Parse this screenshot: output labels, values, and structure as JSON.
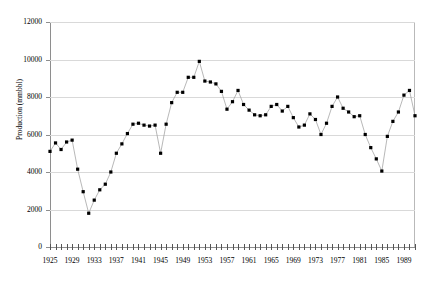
{
  "chart_data": {
    "type": "line",
    "title": "",
    "xlabel": "",
    "ylabel": "Production (mmbbl)",
    "xlim": [
      1925,
      1991
    ],
    "ylim": [
      0,
      12000
    ],
    "grid": true,
    "legend": "none",
    "y_ticks": [
      0,
      2000,
      4000,
      6000,
      8000,
      10000,
      12000
    ],
    "y_tick_labels": [
      "0",
      "2000",
      "4000",
      "6000",
      "8000",
      "10000",
      "12000"
    ],
    "x_tick_labels": [
      "1925",
      "1929",
      "1933",
      "1937",
      "1941",
      "1945",
      "1949",
      "1953",
      "1957",
      "1961",
      "1965",
      "1969",
      "1973",
      "1977",
      "1981",
      "1985",
      "1989"
    ],
    "x_tick_step": 4,
    "x_minor_tick_step": 1,
    "marker": "square",
    "marker_color": "#000000",
    "line_color": "#9a9a9a",
    "x": [
      1925,
      1926,
      1927,
      1928,
      1929,
      1930,
      1931,
      1932,
      1933,
      1934,
      1935,
      1936,
      1937,
      1938,
      1939,
      1940,
      1941,
      1942,
      1943,
      1944,
      1945,
      1946,
      1947,
      1948,
      1949,
      1950,
      1951,
      1952,
      1953,
      1954,
      1955,
      1956,
      1957,
      1958,
      1959,
      1960,
      1961,
      1962,
      1963,
      1964,
      1965,
      1966,
      1967,
      1968,
      1969,
      1970,
      1971,
      1972,
      1973,
      1974,
      1975,
      1976,
      1977,
      1978,
      1979,
      1980,
      1981,
      1982,
      1983,
      1984,
      1985,
      1986,
      1987,
      1988,
      1989,
      1990,
      1991
    ],
    "values": [
      5100,
      5550,
      5200,
      5600,
      5700,
      4150,
      2950,
      1800,
      2500,
      3050,
      3350,
      4000,
      5000,
      5500,
      6050,
      6550,
      6600,
      6500,
      6450,
      6500,
      5000,
      6550,
      7700,
      8250,
      8250,
      9050,
      9050,
      9900,
      8850,
      8800,
      8700,
      8300,
      7350,
      7750,
      8350,
      7600,
      7300,
      7050,
      7000,
      7050,
      7500,
      7600,
      7250,
      7500,
      6900,
      6400,
      6500,
      7100,
      6800,
      6000,
      6600,
      7500,
      8000,
      7400,
      7200,
      6950,
      7000,
      6000,
      5300,
      4700,
      4050,
      5900,
      6700,
      7200,
      8100,
      8350,
      7000
    ]
  }
}
